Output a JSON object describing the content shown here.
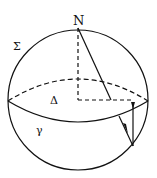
{
  "diagram": {
    "labels": {
      "north": "N",
      "sphere": "Σ",
      "plane": "Δ",
      "curve": "γ"
    },
    "colors": {
      "stroke": "#111111",
      "background": "#ffffff"
    }
  }
}
